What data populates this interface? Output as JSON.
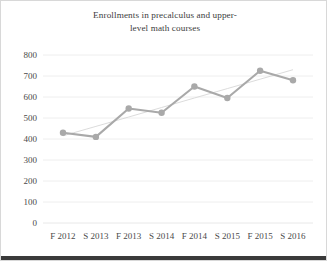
{
  "chart_data": {
    "type": "line",
    "title_line1": "Enrollments in precalculus and upper-",
    "title_line2": "level math courses",
    "xlabel": "",
    "ylabel": "",
    "categories": [
      "F 2012",
      "S 2013",
      "F 2013",
      "S 2014",
      "F 2014",
      "S 2015",
      "F 2015",
      "S 2016"
    ],
    "series": [
      {
        "name": "Enrollments",
        "values": [
          430,
          410,
          545,
          525,
          650,
          595,
          725,
          680
        ],
        "color": "#a9a9a9",
        "marker": "circle"
      },
      {
        "name": "Linear trendline",
        "values": [
          415,
          460,
          505,
          550,
          595,
          640,
          685,
          730
        ],
        "color": "#d7d7d7",
        "marker": "none"
      }
    ],
    "ylim": [
      0,
      800
    ],
    "ytick_values": [
      0,
      100,
      200,
      300,
      400,
      500,
      600,
      700,
      800
    ],
    "ytick_labels": [
      "0",
      "100",
      "200",
      "300",
      "400",
      "500",
      "600",
      "700",
      "800"
    ],
    "grid": true,
    "grid_axis": "y",
    "legend": false,
    "legend_position": "none"
  },
  "colors": {
    "background": "#ffffff",
    "grid": "#eaeaea",
    "text": "#3d3d3d",
    "series": "#a9a9a9",
    "trend": "#d7d7d7"
  }
}
